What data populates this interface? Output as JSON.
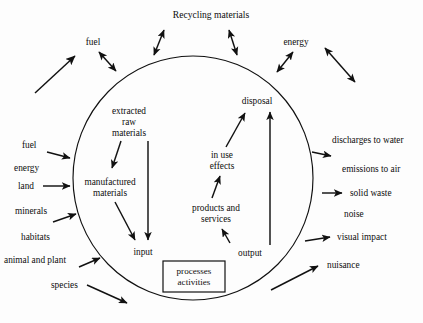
{
  "diagram": {
    "type": "system-boundary-cycle",
    "title": "Recycling materials",
    "central_boundary": {
      "shape": "circle",
      "name": "system boundary"
    },
    "top_labels": {
      "recycling": "Recycling materials",
      "fuel": "fuel",
      "energy": "energy"
    },
    "inputs": [
      {
        "label": "fuel",
        "has_arrow": true
      },
      {
        "label": "energy",
        "has_arrow": false
      },
      {
        "label": "land",
        "has_arrow": true
      },
      {
        "label": "minerals",
        "has_arrow": true
      },
      {
        "label": "habitats",
        "has_arrow": false
      },
      {
        "label": "animal and plant",
        "has_arrow": true
      },
      {
        "label": "species",
        "has_arrow": true
      }
    ],
    "outputs": [
      {
        "label": "discharges to water",
        "has_arrow": true
      },
      {
        "label": "emissions to air",
        "has_arrow": false
      },
      {
        "label": "solid waste",
        "has_arrow": true
      },
      {
        "label": "noise",
        "has_arrow": false
      },
      {
        "label": "visual impact",
        "has_arrow": true
      },
      {
        "label": "nuisance",
        "has_arrow": true
      }
    ],
    "inner_left_chain": [
      "extracted",
      "raw",
      "materials",
      "manufactured",
      "materials",
      "input"
    ],
    "inner_nodes": {
      "extracted_raw_materials_line1": "extracted",
      "extracted_raw_materials_line2": "raw",
      "extracted_raw_materials_line3": "materials",
      "manufactured_materials_line1": "manufactured",
      "manufactured_materials_line2": "materials",
      "input": "input",
      "disposal": "disposal",
      "in_use_effects_line1": "in use",
      "in_use_effects_line2": "effects",
      "products_and_services_line1": "products and",
      "products_and_services_line2": "services",
      "output": "output"
    },
    "process_box": {
      "line1": "processes",
      "line2": "activities"
    },
    "colors": {
      "stroke": "#111111",
      "text": "#0d0d0d",
      "background": "#fdfdfd"
    }
  }
}
